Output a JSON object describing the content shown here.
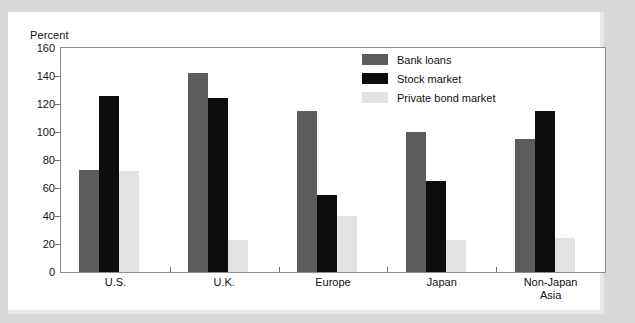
{
  "chart_data": {
    "type": "bar",
    "title": "",
    "xlabel": "",
    "ylabel": "Percent",
    "ylim": [
      0,
      160
    ],
    "yticks": [
      0,
      20,
      40,
      60,
      80,
      100,
      120,
      140,
      160
    ],
    "grid": false,
    "legend_position": "top-right",
    "categories": [
      "U.S.",
      "U.K.",
      "Europe",
      "Japan",
      "Non-Japan\nAsia"
    ],
    "series": [
      {
        "name": "Bank loans",
        "color": "#5c5c5c",
        "values": [
          73,
          142,
          115,
          100,
          95
        ]
      },
      {
        "name": "Stock market",
        "color": "#0d0d0d",
        "values": [
          126,
          124,
          55,
          65,
          115
        ]
      },
      {
        "name": "Private bond market",
        "color": "#e2e2e2",
        "values": [
          72,
          23,
          40,
          23,
          24
        ]
      }
    ]
  },
  "axis": {
    "y_title": "Percent"
  },
  "legend": {
    "items": [
      {
        "label": "Bank loans"
      },
      {
        "label": "Stock market"
      },
      {
        "label": "Private bond market"
      }
    ]
  }
}
